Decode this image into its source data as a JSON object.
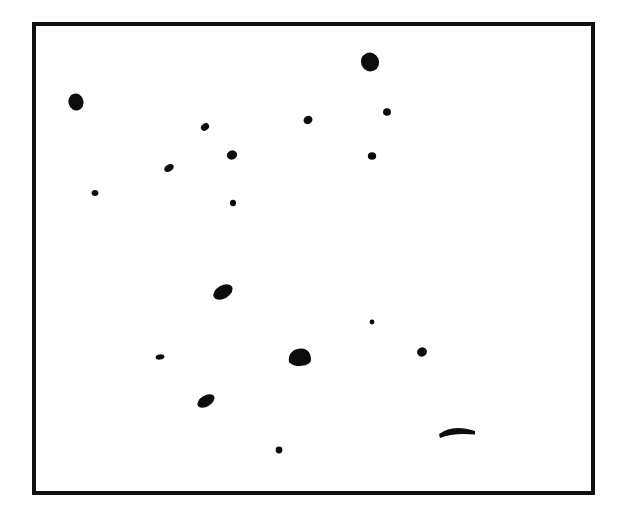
{
  "figure": {
    "kind": "scatter-of-particles",
    "caption_text": "",
    "background_color": "#ffffff",
    "ink_color": "#0d0d0d"
  },
  "frame": {
    "name": "plot-frame",
    "x": 32,
    "y": 22,
    "width": 563,
    "height": 473,
    "border_width": 4,
    "border_color": "#111111",
    "fill_color": "#ffffff"
  },
  "chart_data": {
    "type": "scatter",
    "title": "",
    "subtitle": "",
    "xlabel": "",
    "ylabel": "",
    "xlim": [
      32,
      595
    ],
    "ylim": [
      22,
      495
    ],
    "grid": false,
    "legend": null,
    "annotations": [],
    "marker_color": "#0d0d0d",
    "count": 19,
    "points": [
      {
        "id": "mark-01",
        "x": 370,
        "y": 62,
        "rx": 9.0,
        "ry": 9.5,
        "rot": -25,
        "shape": "oval",
        "size": "large"
      },
      {
        "id": "mark-02",
        "x": 76,
        "y": 102,
        "rx": 7.5,
        "ry": 8.5,
        "rot": -15,
        "shape": "oval",
        "size": "large"
      },
      {
        "id": "mark-03",
        "x": 387,
        "y": 112,
        "rx": 4.0,
        "ry": 3.8,
        "rot": 0,
        "shape": "dot",
        "size": "small"
      },
      {
        "id": "mark-04",
        "x": 308,
        "y": 120,
        "rx": 4.6,
        "ry": 4.0,
        "rot": -30,
        "shape": "dot",
        "size": "small"
      },
      {
        "id": "mark-05",
        "x": 205,
        "y": 127,
        "rx": 4.4,
        "ry": 3.4,
        "rot": -35,
        "shape": "dot",
        "size": "small"
      },
      {
        "id": "mark-06",
        "x": 232,
        "y": 155,
        "rx": 5.2,
        "ry": 4.6,
        "rot": -20,
        "shape": "dot",
        "size": "medium"
      },
      {
        "id": "mark-07",
        "x": 372,
        "y": 156,
        "rx": 4.2,
        "ry": 3.8,
        "rot": 0,
        "shape": "dot",
        "size": "small"
      },
      {
        "id": "mark-08",
        "x": 169,
        "y": 168,
        "rx": 5.2,
        "ry": 3.4,
        "rot": -30,
        "shape": "dot",
        "size": "small"
      },
      {
        "id": "mark-09",
        "x": 95,
        "y": 193,
        "rx": 3.4,
        "ry": 3.0,
        "rot": 0,
        "shape": "dot",
        "size": "tiny"
      },
      {
        "id": "mark-10",
        "x": 233,
        "y": 203,
        "rx": 3.0,
        "ry": 3.2,
        "rot": 0,
        "shape": "dot",
        "size": "tiny"
      },
      {
        "id": "mark-11",
        "x": 223,
        "y": 292,
        "rx": 10.5,
        "ry": 6.5,
        "rot": -30,
        "shape": "ellipse",
        "size": "large"
      },
      {
        "id": "mark-12",
        "x": 372,
        "y": 322,
        "rx": 2.4,
        "ry": 2.4,
        "rot": 0,
        "shape": "dot",
        "size": "tiny"
      },
      {
        "id": "mark-13",
        "x": 160,
        "y": 357,
        "rx": 4.4,
        "ry": 2.6,
        "rot": -5,
        "shape": "dot",
        "size": "tiny"
      },
      {
        "id": "mark-14",
        "x": 300,
        "y": 358,
        "rx": 11.5,
        "ry": 9.0,
        "rot": -10,
        "shape": "blob",
        "size": "xlarge"
      },
      {
        "id": "mark-15",
        "x": 422,
        "y": 352,
        "rx": 5.0,
        "ry": 4.6,
        "rot": -20,
        "shape": "dot",
        "size": "medium"
      },
      {
        "id": "mark-16",
        "x": 206,
        "y": 401,
        "rx": 9.5,
        "ry": 5.5,
        "rot": -32,
        "shape": "ellipse",
        "size": "large"
      },
      {
        "id": "mark-17",
        "x": 457,
        "y": 429,
        "rx": 18.0,
        "ry": 7.0,
        "rot": 0,
        "shape": "crescent",
        "size": "large"
      },
      {
        "id": "mark-18",
        "x": 279,
        "y": 450,
        "rx": 3.4,
        "ry": 3.4,
        "rot": 0,
        "shape": "dot",
        "size": "tiny"
      },
      {
        "id": "mark-19",
        "x": 340,
        "y": 120,
        "rx": 0.0,
        "ry": 0.0,
        "rot": 0,
        "shape": "hidden",
        "size": "none"
      }
    ]
  }
}
